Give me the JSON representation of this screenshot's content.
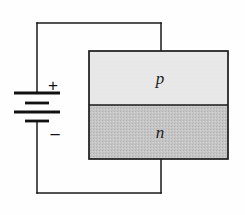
{
  "figure": {
    "background_color": "#fefefe",
    "width": 245,
    "height": 215
  },
  "semiconductor_block": {
    "outline_color": "#1a1a1a",
    "outline_width": 1.6,
    "x": 89,
    "y": 51,
    "width": 139,
    "height": 108,
    "junction_y": 105,
    "regions": [
      {
        "id": "p-region",
        "label": "p",
        "fill_color": "#e8e8e8",
        "texture": "plain",
        "x": 89,
        "y": 51,
        "width": 139,
        "height": 54
      },
      {
        "id": "n-region",
        "label": "n",
        "fill_color": "#c6c6c6",
        "texture": "stipple",
        "x": 89,
        "y": 105,
        "width": 139,
        "height": 54
      }
    ]
  },
  "battery": {
    "terminal_positive_label": "+",
    "terminal_negative_label": "−",
    "center_x": 37,
    "plate_count": 4,
    "plates": [
      {
        "y": 93,
        "half_width": 23,
        "thickness": 2.6
      },
      {
        "y": 103,
        "half_width": 12,
        "thickness": 2.6
      },
      {
        "y": 112,
        "half_width": 23,
        "thickness": 2.6
      },
      {
        "y": 121,
        "half_width": 12,
        "thickness": 2.6
      }
    ],
    "wire_color": "#1a1a1a"
  },
  "wiring": {
    "line_color": "#1a1a1a",
    "line_width": 1.5,
    "left_rail_x": 37,
    "top_rail_y": 23,
    "bottom_rail_y": 193,
    "block_stub_x": 161,
    "top_rail_start_x": 37,
    "top_rail_end_x": 161,
    "bottom_rail_start_x": 37,
    "bottom_rail_end_x": 161
  }
}
